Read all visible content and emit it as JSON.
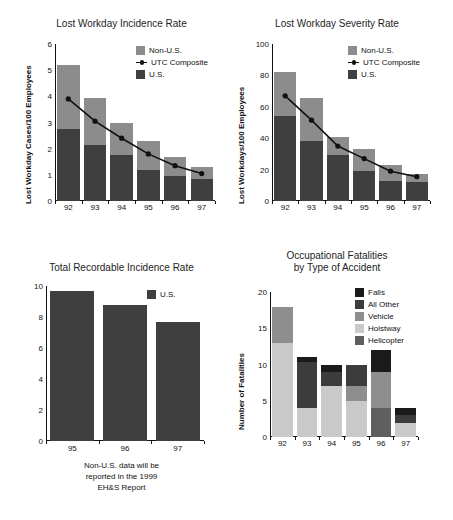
{
  "colors": {
    "us": "#3f3f3f",
    "non_us": "#8c8c8c",
    "line": "#111111",
    "falls": "#1a1a1a",
    "all_other": "#3c3c3c",
    "vehicle": "#8e8e8e",
    "hoistway": "#c9c9c9",
    "helicopter": "#5f5f5f",
    "axis": "#111111",
    "background": "#ffffff"
  },
  "charts": {
    "incidence": {
      "title": "Lost Workday Incidence Rate",
      "ylabel": "Lost Workday Cases/100 Employees",
      "legend": [
        {
          "label": "Non-U.S.",
          "type": "swatch",
          "color": "#8c8c8c"
        },
        {
          "label": "UTC Composite",
          "type": "line",
          "color": "#111111"
        },
        {
          "label": "U.S.",
          "type": "swatch",
          "color": "#3f3f3f"
        }
      ],
      "footnote": ""
    },
    "severity": {
      "title": "Lost Workday Severity Rate",
      "ylabel": "Lost Workdays/100 Employees",
      "legend": [
        {
          "label": "Non-U.S.",
          "type": "swatch",
          "color": "#8c8c8c"
        },
        {
          "label": "UTC Composite",
          "type": "line",
          "color": "#111111"
        },
        {
          "label": "U.S.",
          "type": "swatch",
          "color": "#3f3f3f"
        }
      ]
    },
    "recordable": {
      "title": "Total Recordable Incidence Rate",
      "ylabel": "",
      "legend": [
        {
          "label": "U.S.",
          "type": "swatch",
          "color": "#3f3f3f"
        }
      ],
      "footnote": "Non-U.S. data will be\nreported in the 1999\nEH&S Report"
    },
    "fatalities": {
      "title": "Occupational Fatalities\nby Type of Accident",
      "ylabel": "Number of Fatalities",
      "legend": [
        {
          "label": "Falls",
          "type": "swatch",
          "color": "#1a1a1a"
        },
        {
          "label": "All Other",
          "type": "swatch",
          "color": "#3c3c3c"
        },
        {
          "label": "Vehicle",
          "type": "swatch",
          "color": "#8e8e8e"
        },
        {
          "label": "Hoistway",
          "type": "swatch",
          "color": "#c9c9c9"
        },
        {
          "label": "Helicopter",
          "type": "swatch",
          "color": "#5f5f5f"
        }
      ]
    }
  },
  "chart_data": [
    {
      "id": "incidence",
      "type": "bar",
      "title": "Lost Workday Incidence Rate",
      "xlabel": "",
      "ylabel": "Lost Workday Cases/100 Employees",
      "categories": [
        "92",
        "93",
        "94",
        "95",
        "96",
        "97"
      ],
      "ylim": [
        0,
        6
      ],
      "yticks": [
        0,
        1,
        2,
        3,
        4,
        5,
        6
      ],
      "grid": false,
      "legend_position": "top-right",
      "stacked": true,
      "series": [
        {
          "name": "U.S.",
          "values": [
            2.75,
            2.15,
            1.75,
            1.2,
            0.95,
            0.85
          ]
        },
        {
          "name": "Non-U.S.",
          "values": [
            2.45,
            1.8,
            1.25,
            1.1,
            0.75,
            0.45
          ]
        }
      ],
      "totals": [
        5.2,
        3.95,
        3.0,
        2.3,
        1.7,
        1.3
      ],
      "overlay_line": {
        "name": "UTC Composite",
        "values": [
          3.9,
          3.05,
          2.4,
          1.8,
          1.35,
          1.05
        ]
      }
    },
    {
      "id": "severity",
      "type": "bar",
      "title": "Lost Workday Severity Rate",
      "xlabel": "",
      "ylabel": "Lost Workdays/100 Employees",
      "categories": [
        "92",
        "93",
        "94",
        "95",
        "96",
        "97"
      ],
      "ylim": [
        0,
        100
      ],
      "yticks": [
        0,
        20,
        40,
        60,
        80,
        100
      ],
      "grid": false,
      "legend_position": "top-right",
      "stacked": true,
      "series": [
        {
          "name": "U.S.",
          "values": [
            54,
            38.5,
            29,
            19,
            13,
            12
          ]
        },
        {
          "name": "Non-U.S.",
          "values": [
            28,
            27,
            11.5,
            14,
            10,
            5
          ]
        }
      ],
      "totals": [
        82,
        65.5,
        40.5,
        33,
        23,
        17
      ],
      "overlay_line": {
        "name": "UTC Composite",
        "values": [
          67,
          51.5,
          35,
          27,
          19,
          15.5
        ]
      }
    },
    {
      "id": "recordable",
      "type": "bar",
      "title": "Total Recordable Incidence Rate",
      "xlabel": "",
      "ylabel": "",
      "categories": [
        "95",
        "96",
        "97"
      ],
      "ylim": [
        0,
        10
      ],
      "yticks": [
        0,
        2,
        4,
        6,
        8,
        10
      ],
      "grid": false,
      "legend_position": "top-right",
      "series": [
        {
          "name": "U.S.",
          "values": [
            9.7,
            8.8,
            7.65
          ]
        }
      ],
      "annotation": "Non-U.S. data will be reported in the 1999 EH&S Report"
    },
    {
      "id": "fatalities",
      "type": "bar",
      "title": "Occupational Fatalities by Type of Accident",
      "xlabel": "",
      "ylabel": "Number of Fatalities",
      "categories": [
        "92",
        "93",
        "94",
        "95",
        "96",
        "97"
      ],
      "ylim": [
        0,
        20
      ],
      "yticks": [
        0,
        5,
        10,
        15,
        20
      ],
      "grid": false,
      "legend_position": "top-right",
      "stacked": true,
      "series": [
        {
          "name": "Hoistway",
          "values": [
            13,
            4,
            7,
            5,
            0,
            2
          ]
        },
        {
          "name": "Helicopter",
          "values": [
            0,
            0,
            0,
            0,
            4,
            0
          ]
        },
        {
          "name": "Vehicle",
          "values": [
            5,
            0,
            0,
            2,
            5,
            0
          ]
        },
        {
          "name": "All Other",
          "values": [
            0,
            6.4,
            2,
            3,
            0,
            1
          ]
        },
        {
          "name": "Falls",
          "values": [
            0,
            0.6,
            1,
            0,
            3,
            1
          ]
        }
      ],
      "totals": [
        18,
        11,
        10,
        10,
        12,
        4
      ]
    }
  ]
}
